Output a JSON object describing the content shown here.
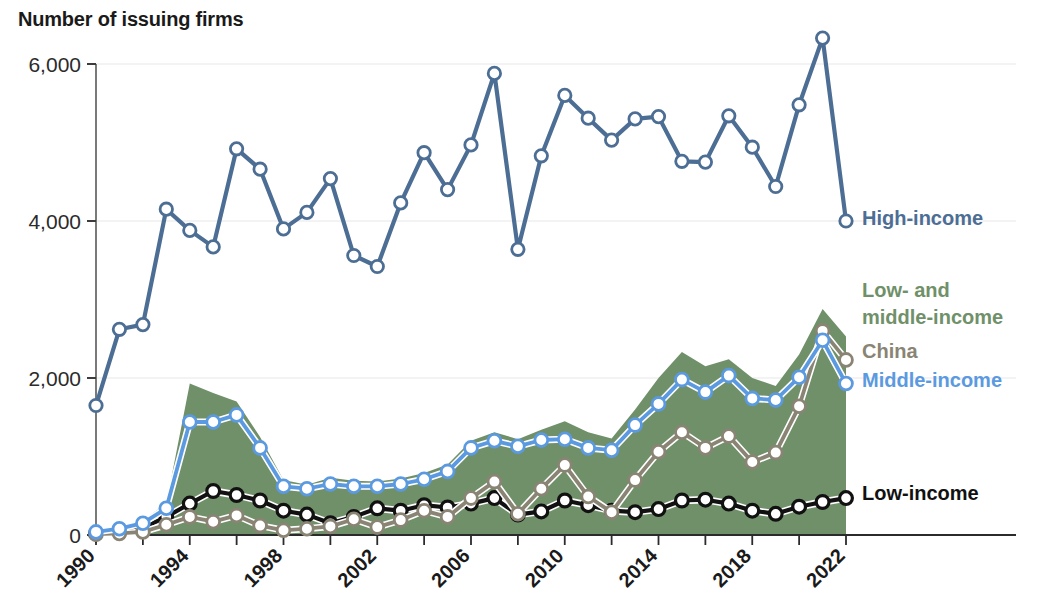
{
  "chart_title": "Number of issuing firms",
  "legend": [
    {
      "name": "high-income",
      "label": "High-income",
      "color": "#4d6e94"
    },
    {
      "name": "low-and-middle-income",
      "label": "Low- and middle-income",
      "color": "#6f9069"
    },
    {
      "name": "china",
      "label": "China",
      "color": "#8a8474"
    },
    {
      "name": "middle-income",
      "label": "Middle-income",
      "color": "#5b9ae0"
    },
    {
      "name": "low-income",
      "label": "Low-income",
      "color": "#111111"
    }
  ],
  "axis": {
    "y_ticks": [
      "0",
      "2,000",
      "4,000",
      "6,000"
    ],
    "x_ticks": [
      "1990",
      "1994",
      "1998",
      "2002",
      "2006",
      "2010",
      "2014",
      "2018",
      "2022"
    ]
  },
  "chart_data": {
    "type": "line",
    "title": "Number of issuing firms",
    "xlabel": "",
    "ylabel": "Number of issuing firms",
    "ylim": [
      0,
      6400
    ],
    "xlim": [
      1990,
      2022
    ],
    "grid": true,
    "legend_position": "right",
    "x": [
      1990,
      1991,
      1992,
      1993,
      1994,
      1995,
      1996,
      1997,
      1998,
      1999,
      2000,
      2001,
      2002,
      2003,
      2004,
      2005,
      2006,
      2007,
      2008,
      2009,
      2010,
      2011,
      2012,
      2013,
      2014,
      2015,
      2016,
      2017,
      2018,
      2019,
      2020,
      2021,
      2022
    ],
    "series": [
      {
        "name": "High-income",
        "color": "#4d6e94",
        "style": "line-marker",
        "values": [
          1650,
          2620,
          2680,
          4150,
          3880,
          3670,
          4920,
          4660,
          3900,
          4110,
          4540,
          3560,
          3420,
          4230,
          4870,
          4400,
          4970,
          5880,
          3640,
          4830,
          5600,
          5310,
          5030,
          5300,
          5330,
          4760,
          4750,
          5340,
          4940,
          4440,
          5480,
          6330,
          4000
        ]
      },
      {
        "name": "Low- and middle-income",
        "color": "#6f9069",
        "style": "area",
        "values": [
          60,
          110,
          190,
          400,
          1930,
          1810,
          1700,
          1250,
          700,
          640,
          730,
          690,
          680,
          720,
          790,
          900,
          1200,
          1310,
          1220,
          1340,
          1450,
          1310,
          1230,
          1600,
          2000,
          2330,
          2150,
          2240,
          2000,
          1900,
          2300,
          2880,
          2530
        ]
      },
      {
        "name": "Middle-income",
        "color": "#5b9ae0",
        "style": "line-marker",
        "values": [
          40,
          80,
          150,
          340,
          1440,
          1440,
          1530,
          1110,
          620,
          590,
          650,
          620,
          620,
          650,
          710,
          810,
          1110,
          1200,
          1130,
          1210,
          1220,
          1110,
          1080,
          1400,
          1670,
          1980,
          1820,
          2030,
          1740,
          1720,
          2010,
          2480,
          1930
        ]
      },
      {
        "name": "China",
        "color": "#8a8474",
        "style": "line-marker",
        "values": [
          10,
          20,
          40,
          130,
          230,
          170,
          250,
          120,
          60,
          80,
          110,
          200,
          100,
          190,
          310,
          230,
          470,
          680,
          270,
          590,
          890,
          490,
          290,
          700,
          1060,
          1310,
          1110,
          1260,
          930,
          1050,
          1640,
          2600,
          2230
        ]
      },
      {
        "name": "Low-income",
        "color": "#111111",
        "style": "line-marker",
        "values": [
          20,
          40,
          90,
          230,
          400,
          560,
          510,
          440,
          310,
          260,
          150,
          230,
          340,
          310,
          380,
          350,
          400,
          470,
          260,
          300,
          440,
          380,
          310,
          290,
          330,
          440,
          450,
          400,
          310,
          270,
          360,
          420,
          470
        ]
      }
    ]
  }
}
